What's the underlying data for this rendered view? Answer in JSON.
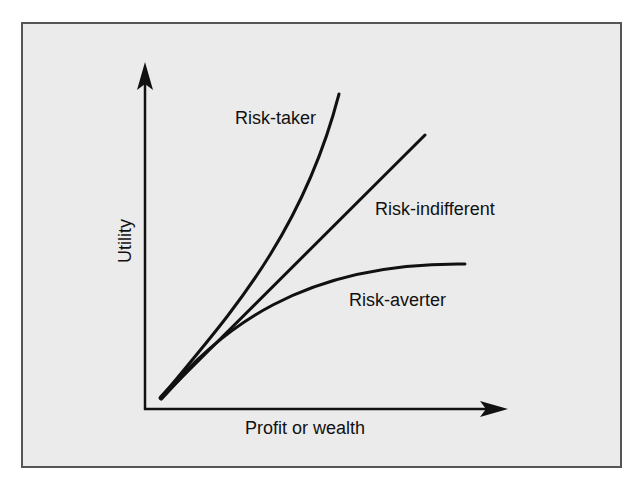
{
  "diagram": {
    "axes": {
      "x_label": "Profit or wealth",
      "y_label": "Utility"
    },
    "curves": [
      {
        "id": "risk-taker",
        "label": "Risk-taker",
        "shape": "convex"
      },
      {
        "id": "risk-indifferent",
        "label": "Risk-indifferent",
        "shape": "linear"
      },
      {
        "id": "risk-averter",
        "label": "Risk-averter",
        "shape": "concave"
      }
    ],
    "colors": {
      "frame_background": "#ebebeb",
      "frame_border": "#555555",
      "line": "#111111"
    }
  }
}
